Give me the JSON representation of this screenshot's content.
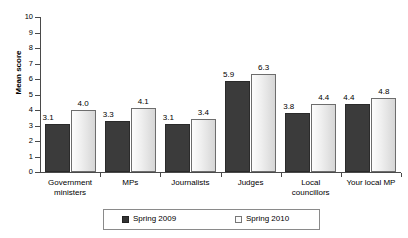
{
  "chart_data": {
    "type": "bar",
    "title": "",
    "xlabel": "",
    "ylabel": "Mean score",
    "ylim": [
      0,
      10
    ],
    "ytick_step": 1,
    "yticks": [
      "10",
      "9",
      "8",
      "7",
      "6",
      "5",
      "4",
      "3",
      "2",
      "1",
      "0"
    ],
    "grid": false,
    "legend_position": "bottom",
    "categories": [
      "Government ministers",
      "MPs",
      "Journalists",
      "Judges",
      "Local councillors",
      "Your local MP"
    ],
    "category_lines": [
      [
        "Government",
        "ministers"
      ],
      [
        "MPs"
      ],
      [
        "Journalists"
      ],
      [
        "Judges"
      ],
      [
        "Local",
        "councillors"
      ],
      [
        "Your local MP"
      ]
    ],
    "series": [
      {
        "name": "Spring 2009",
        "color": "#3b3b3b",
        "values": [
          3.1,
          3.3,
          3.1,
          5.9,
          3.8,
          4.4
        ],
        "labels": [
          "3.1",
          "3.3",
          "3.1",
          "5.9",
          "3.8",
          "4.4"
        ]
      },
      {
        "name": "Spring 2010",
        "color": "#e8e8e8",
        "values": [
          4.0,
          4.1,
          3.4,
          6.3,
          4.4,
          4.8
        ],
        "labels": [
          "4.0",
          "4.1",
          "3.4",
          "6.3",
          "4.4",
          "4.8"
        ]
      }
    ]
  },
  "legend": {
    "items": [
      {
        "label": "Spring 2009",
        "swatch": "dark-square-icon"
      },
      {
        "label": "Spring 2010",
        "swatch": "light-square-icon"
      }
    ]
  }
}
